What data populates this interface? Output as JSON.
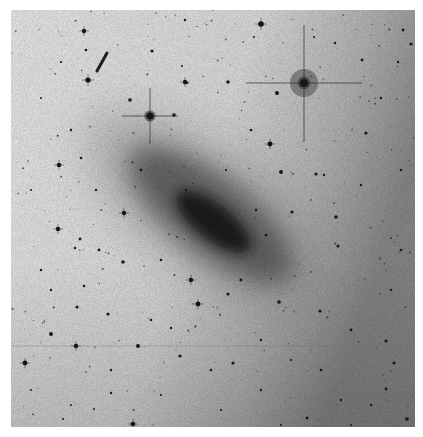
{
  "image": {
    "subject": "negative sky survey plate of an inclined spiral galaxy with field stars",
    "frame": {
      "x": 11,
      "y": 10,
      "width": 404,
      "height": 417
    },
    "colors": {
      "sky_light": "#f2f2f2",
      "sky_mid": "#cfcfcf",
      "sky_dark_edge": "#8a8a8a",
      "galaxy_halo": "#9a9a9a",
      "galaxy_disk": "#555555",
      "galaxy_core": "#151515",
      "star": "#1a1a1a"
    },
    "galaxy": {
      "cx": 200,
      "cy": 205,
      "angle": 38,
      "halo": [
        150,
        62
      ],
      "disk": [
        100,
        38
      ],
      "core": [
        46,
        18
      ]
    },
    "bright_stars": [
      {
        "x": 293,
        "y": 73,
        "r": 4,
        "halo": 14,
        "spike": 58
      },
      {
        "x": 139,
        "y": 106,
        "r": 3.5,
        "halo": 0,
        "spike": 28
      }
    ],
    "streak": {
      "x1": 96,
      "y1": 43,
      "x2": 86,
      "y2": 61
    },
    "scan_line_y": 336,
    "stars": [
      [
        73,
        21,
        2.2
      ],
      [
        141,
        41,
        1.6
      ],
      [
        174,
        10,
        1.2
      ],
      [
        250,
        14,
        2.8
      ],
      [
        243,
        27,
        1
      ],
      [
        303,
        27,
        1
      ],
      [
        324,
        33,
        1.2
      ],
      [
        392,
        20,
        1.4
      ],
      [
        50,
        52,
        1.1
      ],
      [
        75,
        40,
        1.3
      ],
      [
        77,
        70,
        2.6
      ],
      [
        171,
        56,
        1
      ],
      [
        176,
        73,
        1.3
      ],
      [
        163,
        105,
        1.8
      ],
      [
        119,
        90,
        1.8
      ],
      [
        174,
        72,
        2.2
      ],
      [
        217,
        72,
        1.8
      ],
      [
        266,
        83,
        2
      ],
      [
        259,
        134,
        2.4
      ],
      [
        351,
        50,
        1.4
      ],
      [
        370,
        88,
        1.2
      ],
      [
        387,
        52,
        1.2
      ],
      [
        400,
        34,
        1.6
      ],
      [
        355,
        123,
        1.6
      ],
      [
        30,
        88,
        1
      ],
      [
        60,
        120,
        1.2
      ],
      [
        48,
        155,
        2.2
      ],
      [
        70,
        148,
        1.3
      ],
      [
        270,
        162,
        2
      ],
      [
        305,
        164,
        1.6
      ],
      [
        113,
        203,
        2.2
      ],
      [
        112,
        252,
        1.8
      ],
      [
        47,
        219,
        2.2
      ],
      [
        69,
        229,
        1.4
      ],
      [
        64,
        238,
        1.2
      ],
      [
        73,
        276,
        1.3
      ],
      [
        97,
        304,
        1.6
      ],
      [
        66,
        297,
        1.6
      ],
      [
        40,
        324,
        2
      ],
      [
        65,
        336,
        2.2
      ],
      [
        127,
        336,
        2
      ],
      [
        169,
        346,
        1.6
      ],
      [
        14,
        353,
        2.4
      ],
      [
        187,
        294,
        2.4
      ],
      [
        217,
        284,
        1.6
      ],
      [
        268,
        292,
        1.8
      ],
      [
        309,
        301,
        1.6
      ],
      [
        375,
        331,
        1.6
      ],
      [
        383,
        353,
        1.6
      ],
      [
        375,
        379,
        1.4
      ],
      [
        396,
        409,
        1.8
      ],
      [
        296,
        408,
        1.4
      ],
      [
        122,
        414,
        2.3
      ],
      [
        52,
        409,
        1
      ],
      [
        83,
        399,
        1
      ],
      [
        100,
        383,
        1.2
      ],
      [
        281,
        202,
        1.6
      ],
      [
        325,
        207,
        1.8
      ],
      [
        327,
        236,
        1.6
      ],
      [
        313,
        165,
        1.2
      ],
      [
        340,
        320,
        1.4
      ],
      [
        222,
        353,
        1.6
      ],
      [
        180,
        270,
        2.2
      ],
      [
        88,
        240,
        1.4
      ],
      [
        140,
        310,
        1.2
      ],
      [
        160,
        318,
        1.2
      ],
      [
        200,
        360,
        1.2
      ],
      [
        250,
        380,
        1.2
      ],
      [
        310,
        360,
        1.3
      ],
      [
        360,
        395,
        1.2
      ],
      [
        40,
        280,
        1.2
      ],
      [
        20,
        180,
        1
      ],
      [
        30,
        260,
        1.2
      ],
      [
        85,
        180,
        1.2
      ],
      [
        240,
        120,
        1.3
      ],
      [
        350,
        175,
        1.2
      ],
      [
        390,
        160,
        1.2
      ],
      [
        390,
        240,
        1.2
      ],
      [
        380,
        280,
        1.2
      ],
      [
        250,
        330,
        1.2
      ],
      [
        280,
        350,
        1.1
      ],
      [
        330,
        390,
        1.2
      ],
      [
        150,
        385,
        1.1
      ],
      [
        100,
        360,
        1.2
      ],
      [
        20,
        380,
        1
      ],
      [
        60,
        395,
        1
      ],
      [
        210,
        400,
        1.1
      ],
      [
        270,
        415,
        1
      ],
      [
        340,
        415,
        1
      ],
      [
        130,
        160,
        1.4
      ],
      [
        150,
        250,
        1.3
      ],
      [
        230,
        270,
        1.4
      ],
      [
        255,
        225,
        1.3
      ],
      [
        175,
        180,
        1.2
      ],
      [
        245,
        200,
        1.2
      ],
      [
        215,
        160,
        1.1
      ]
    ]
  }
}
